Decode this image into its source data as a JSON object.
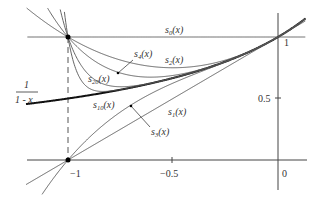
{
  "figure": {
    "axis_color": "#444444",
    "curve_color": "#555555",
    "main_curve_color": "#111111"
  },
  "axes": {
    "x_ticks": [
      {
        "value": -1,
        "label": "−1"
      },
      {
        "value": -0.5,
        "label": "−0.5"
      },
      {
        "value": 0,
        "label": "0"
      }
    ],
    "y_ticks": [
      {
        "value": 0.5,
        "label": "0.5"
      },
      {
        "value": 1,
        "label": "1"
      }
    ],
    "x_range": [
      -1.2,
      0.13
    ],
    "y_range": [
      -0.25,
      1.25
    ]
  },
  "labels": {
    "main_curve": {
      "numerator": "1",
      "denominator": "1 - x"
    },
    "s0": {
      "base": "s",
      "sub": "0",
      "arg": "(x)"
    },
    "s1": {
      "base": "s",
      "sub": "1",
      "arg": "(x)"
    },
    "s2": {
      "base": "s",
      "sub": "2",
      "arg": "(x)"
    },
    "s3": {
      "base": "s",
      "sub": "3",
      "arg": "(x)"
    },
    "s4": {
      "base": "s",
      "sub": "4",
      "arg": "(x)"
    },
    "s10": {
      "base": "s",
      "sub": "10",
      "arg": "(x)"
    },
    "s20": {
      "base": "s",
      "sub": "20",
      "arg": "(x)"
    }
  },
  "curves": [
    {
      "name": "1/(1-x)",
      "n": null
    },
    {
      "name": "s0",
      "n": 0
    },
    {
      "name": "s1",
      "n": 1
    },
    {
      "name": "s2",
      "n": 2
    },
    {
      "name": "s3",
      "n": 3
    },
    {
      "name": "s4",
      "n": 4
    },
    {
      "name": "s10",
      "n": 10
    },
    {
      "name": "s20",
      "n": 20
    }
  ],
  "points": [
    {
      "x": -1,
      "y": 1,
      "note": "even partial sums meet"
    },
    {
      "x": -1,
      "y": 0,
      "note": "odd partial sums meet"
    }
  ]
}
